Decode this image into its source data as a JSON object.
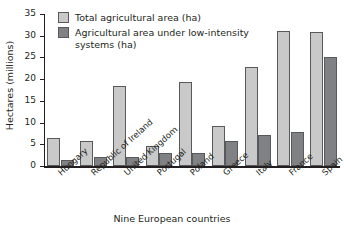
{
  "chart_data": {
    "type": "bar",
    "title": "",
    "xlabel": "Nine European countries",
    "ylabel": "Hectares (millions)",
    "ylim": [
      0,
      35
    ],
    "yticks": [
      0,
      5,
      10,
      15,
      20,
      25,
      30,
      35
    ],
    "grid": false,
    "legend_position": "top-left",
    "categories": [
      "Hungary",
      "Republic of Ireland",
      "United Kingdom",
      "Portugal",
      "Poland",
      "Greece",
      "Italy",
      "France",
      "Spain"
    ],
    "series": [
      {
        "name": "Total agricultural area (ha)",
        "color": "#c9c9c9",
        "values": [
          6.5,
          5.7,
          18.5,
          4.7,
          19.3,
          9.3,
          22.8,
          31.2,
          30.8
        ]
      },
      {
        "name": "Agricultural area under low-intensity\nsystems (ha)",
        "color": "#808184",
        "values": [
          1.5,
          2.1,
          2.1,
          2.9,
          2.9,
          5.7,
          7.2,
          7.9,
          25.2
        ]
      }
    ]
  },
  "axes": {
    "y_tick_labels": [
      "0",
      "5",
      "10",
      "15",
      "20",
      "25",
      "30",
      "35"
    ],
    "y_axis_title": "Hectares (millions)",
    "x_axis_title": "Nine European countries"
  },
  "legend": {
    "items": [
      {
        "label": "Total agricultural area (ha)",
        "swatch": "light"
      },
      {
        "label": "Agricultural area under low-intensity\nsystems (ha)",
        "swatch": "dark"
      }
    ]
  },
  "colors": {
    "light_bar": "#c9c9c9",
    "dark_bar": "#808184",
    "bar_outline": "#58595b",
    "axis": "#231f20",
    "background": "#ffffff"
  },
  "caption_sliver": ""
}
